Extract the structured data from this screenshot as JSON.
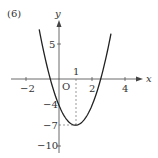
{
  "problem_label": "(6)",
  "chart_data": {
    "type": "line",
    "title": "(6)",
    "function": "y = 3x^2 - 6x - 4",
    "xlabel": "x",
    "ylabel": "y",
    "origin_label": "O",
    "x_ticks": [
      -2,
      2,
      4
    ],
    "x_tick_labels": [
      "−2",
      "2",
      "4"
    ],
    "y_ticks": [
      5,
      -4,
      -7,
      -10
    ],
    "y_tick_labels": [
      "5",
      "−4",
      "−7",
      "−10"
    ],
    "annotations": [
      {
        "text": "1",
        "note": "x-coordinate of vertex, marked above x-axis with dashed line"
      },
      {
        "text": "−7",
        "note": "y-coordinate of vertex, dashed line to y-axis"
      }
    ],
    "vertex": {
      "x": 1,
      "y": -7
    },
    "y_intercept": {
      "x": 0,
      "y": -4
    },
    "x_intercepts": [
      -0.53,
      2.53
    ],
    "xlim": [
      -2.8,
      4.6
    ],
    "ylim": [
      -10.6,
      9
    ],
    "grid": false,
    "curve_x": [
      -1.2,
      -1,
      -0.5,
      0,
      0.5,
      1,
      1.5,
      2,
      2.5,
      3,
      3.15
    ],
    "curve_y": [
      7.52,
      5,
      -0.25,
      -4,
      -6.25,
      -7,
      -6.25,
      -4,
      -0.25,
      5,
      6.87
    ]
  },
  "labels": {
    "x_axis": "x",
    "y_axis": "y",
    "origin": "O",
    "vertex_x": "1",
    "xt_m2": "−2",
    "xt_2": "2",
    "xt_4": "4",
    "yt_5": "5",
    "yt_m4": "−4",
    "yt_m7": "−7",
    "yt_m10": "−10"
  }
}
